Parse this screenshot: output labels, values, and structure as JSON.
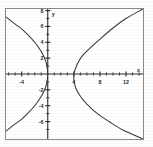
{
  "figure": {
    "title": "",
    "background_color": "#ffffff",
    "frame_color": "#8a8a8a",
    "curve_color": "#3a3a3a",
    "axis_color": "#2b2b2b"
  },
  "chart_data": {
    "type": "line",
    "title": "",
    "xlabel": "x",
    "ylabel": "y",
    "xlim": [
      -6.4,
      14.6
    ],
    "ylim": [
      -8.2,
      8.2
    ],
    "grid": false,
    "legend": "none",
    "xticks": [
      -4,
      4,
      8,
      12
    ],
    "xticklabels": [
      "-4",
      "4",
      "8",
      "12"
    ],
    "yticks": [
      8,
      6,
      4,
      2,
      -2,
      -4,
      -6
    ],
    "yticklabels": [
      "8",
      "6",
      "4",
      "2",
      "-2",
      "-4",
      "-6"
    ],
    "minor_xticks": [
      -6,
      -5,
      -3,
      -2,
      -1,
      1,
      2,
      3,
      5,
      6,
      7,
      9,
      10,
      11,
      13,
      14
    ],
    "minor_yticks": [
      7,
      5,
      3,
      1,
      -1,
      -3,
      -5,
      -7
    ],
    "series": [
      {
        "name": "left-opening parabola",
        "equation": "x = -y^2/8",
        "orientation": "opens-left",
        "vertex": [
          0,
          0
        ],
        "points": [
          [
            -6.4,
            7.2
          ],
          [
            -5.0,
            6.3
          ],
          [
            -4.0,
            5.7
          ],
          [
            -3.0,
            4.9
          ],
          [
            -2.0,
            4.0
          ],
          [
            -1.2,
            3.1
          ],
          [
            -0.6,
            2.2
          ],
          [
            -0.2,
            1.3
          ],
          [
            0,
            0
          ],
          [
            -0.2,
            -1.3
          ],
          [
            -0.6,
            -2.2
          ],
          [
            -1.2,
            -3.1
          ],
          [
            -2.0,
            -4.0
          ],
          [
            -3.0,
            -4.9
          ],
          [
            -4.0,
            -5.7
          ],
          [
            -5.0,
            -6.3
          ],
          [
            -6.4,
            -7.2
          ]
        ]
      },
      {
        "name": "right-opening parabola",
        "equation": "x = 4 + y^2/8",
        "orientation": "opens-right",
        "vertex": [
          4,
          -0.6
        ],
        "points": [
          [
            14.6,
            8.2
          ],
          [
            12.0,
            7.0
          ],
          [
            10.0,
            5.8
          ],
          [
            8.0,
            4.4
          ],
          [
            6.4,
            3.2
          ],
          [
            5.2,
            2.2
          ],
          [
            4.5,
            1.2
          ],
          [
            4.1,
            0.3
          ],
          [
            4.0,
            -0.6
          ],
          [
            4.3,
            -1.8
          ],
          [
            5.0,
            -2.8
          ],
          [
            6.0,
            -3.8
          ],
          [
            7.6,
            -5.0
          ],
          [
            9.4,
            -6.0
          ],
          [
            11.6,
            -7.1
          ],
          [
            14.6,
            -8.2
          ]
        ]
      }
    ]
  },
  "labels": {
    "x_axis_label": "x",
    "y_axis_label": "y"
  }
}
